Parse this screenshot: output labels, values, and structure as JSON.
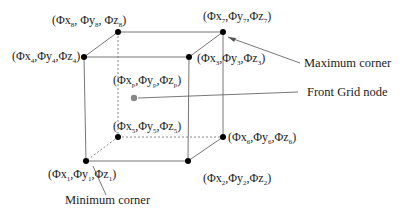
{
  "diagram": {
    "nodes": [
      {
        "id": "n1",
        "label": "(Φx₁,Φy₁,Φz₁)",
        "position": "front-bottom-left"
      },
      {
        "id": "n2",
        "label": "(Φx₂,Φy₂,Φz₂)",
        "position": "front-bottom-right"
      },
      {
        "id": "n3",
        "label": "(Φx₃,Φy₃,Φz₃)",
        "position": "front-top-right"
      },
      {
        "id": "n4",
        "label": "(Φx₄,Φy₄,Φz₄)",
        "position": "front-top-left"
      },
      {
        "id": "n5",
        "label": "(Φx₅,Φy₅,Φz₅)",
        "position": "back-bottom-left"
      },
      {
        "id": "n6",
        "label": "(Φx₆,Φy₆,Φz₆)",
        "position": "back-bottom-right"
      },
      {
        "id": "n7",
        "label": "(Φx₇,Φy₇,Φz₇)",
        "position": "back-top-right"
      },
      {
        "id": "n8",
        "label": "(Φx₈,Φy₈,Φz₈)",
        "position": "back-top-left"
      },
      {
        "id": "np",
        "label": "(Φxₚ,Φyₚ,Φzₚ)",
        "position": "interior"
      }
    ],
    "callouts": {
      "maximum_corner": "Maximum corner",
      "front_grid_node": "Front Grid node",
      "minimum_corner": "Minimum corner"
    },
    "colors": {
      "line": "#777777",
      "node": "#000000",
      "grid_node": "#888888"
    }
  }
}
